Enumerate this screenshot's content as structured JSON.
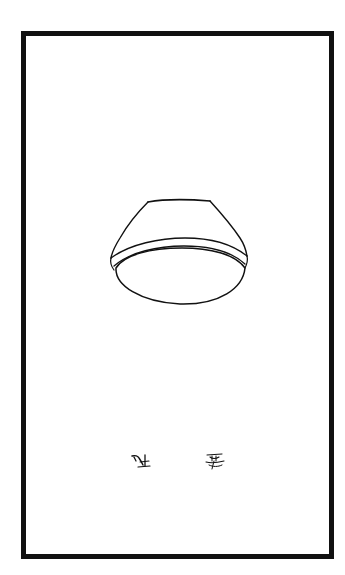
{
  "page": {
    "background_color": "#ffffff",
    "ink_color": "#111111"
  },
  "illustration": {
    "subject": "inverted bowl",
    "description": "Line drawing of an upside-down bowl with a rim band, centered in a bordered frame"
  },
  "marks": [
    {
      "name": "seal-mark-left",
      "description": "small illegible calligraphic mark"
    },
    {
      "name": "seal-mark-right",
      "description": "small illegible calligraphic mark"
    }
  ]
}
